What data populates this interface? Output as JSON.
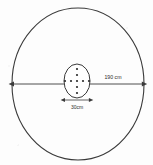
{
  "figure": {
    "background_color": "#fdfdfd",
    "ink_color": "#3a3a3a",
    "outer_circle": {
      "name": "outer-circle",
      "center_x": 78,
      "center_y": 84,
      "radius_x": 66,
      "radius_y": 76
    },
    "inner_circle": {
      "name": "inner-circle",
      "center_x": 77,
      "center_y": 81,
      "radius_x": 13,
      "radius_y": 17
    },
    "dots": {
      "name": "dot-cluster",
      "arrangement": "cross",
      "vertical_count": 5,
      "horizontal_count": 5,
      "radius": 1.1,
      "spacing": 5,
      "vertical_points": [
        {
          "x": 77,
          "y": 69
        },
        {
          "x": 77,
          "y": 75
        },
        {
          "x": 77,
          "y": 81
        },
        {
          "x": 77,
          "y": 87
        },
        {
          "x": 77,
          "y": 93
        }
      ],
      "horizontal_points": [
        {
          "x": 65,
          "y": 81
        },
        {
          "x": 71,
          "y": 81
        },
        {
          "x": 77,
          "y": 81
        },
        {
          "x": 83,
          "y": 81
        },
        {
          "x": 89,
          "y": 81
        }
      ]
    },
    "diameter_arrow": {
      "name": "diameter-dimension-line",
      "x1": 13,
      "x2": 143,
      "y": 84,
      "label": "190 cm",
      "label_x": 113,
      "label_y": 78
    },
    "inner_arrow": {
      "name": "inner-diameter-dimension-line",
      "x1": 64,
      "x2": 90,
      "y": 100,
      "label": "30cm",
      "label_x": 77,
      "label_y": 109
    }
  }
}
